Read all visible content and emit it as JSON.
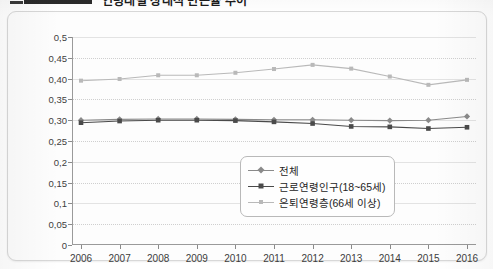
{
  "page": {
    "title_bar": {
      "badge_name": "black-label-block",
      "title_text_fragment": "연령대별 상대적 빈곤율 추이",
      "note": "title row is cropped at the top edge of the screenshot"
    }
  },
  "chart_data": {
    "type": "line",
    "title": "",
    "xlabel": "",
    "ylabel": "",
    "x": [
      2006,
      2007,
      2008,
      2009,
      2010,
      2011,
      2012,
      2013,
      2014,
      2015,
      2016
    ],
    "categories": [
      "2006",
      "2007",
      "2008",
      "2009",
      "2010",
      "2011",
      "2012",
      "2013",
      "2014",
      "2015",
      "2016"
    ],
    "ylim": [
      0,
      0.5
    ],
    "yticks": [
      0,
      0.05,
      0.1,
      0.15,
      0.2,
      0.25,
      0.3,
      0.35,
      0.4,
      0.45,
      0.5
    ],
    "ytick_labels": [
      "0",
      "0,05",
      "0,1",
      "0,15",
      "0,2",
      "0,25",
      "0,30",
      "0,35",
      "0,40",
      "0,45",
      "0,5"
    ],
    "grid": true,
    "grid_style": "dotted-horizontal",
    "legend_position": "lower-right-inside",
    "series": [
      {
        "name": "전체",
        "marker": "diamond",
        "color": "#8a8a8a",
        "values": [
          0.3,
          0.302,
          0.303,
          0.303,
          0.302,
          0.301,
          0.301,
          0.3,
          0.299,
          0.3,
          0.309
        ]
      },
      {
        "name": "근로연령인구(18~65세)",
        "marker": "square",
        "color": "#4a4a4a",
        "values": [
          0.294,
          0.298,
          0.3,
          0.3,
          0.299,
          0.296,
          0.292,
          0.285,
          0.284,
          0.28,
          0.283
        ]
      },
      {
        "name": "은퇴연령층(66세 이상)",
        "marker": "square-small",
        "color": "#b9b9b9",
        "values": [
          0.395,
          0.399,
          0.408,
          0.408,
          0.414,
          0.423,
          0.433,
          0.424,
          0.405,
          0.385,
          0.397
        ]
      }
    ]
  },
  "legend": {
    "items": [
      {
        "label": "전체",
        "marker": "diamond",
        "color": "#8a8a8a"
      },
      {
        "label": "근로연령인구(18~65세)",
        "marker": "square",
        "color": "#4a4a4a"
      },
      {
        "label": "은퇴연령층(66세 이상)",
        "marker": "square-small",
        "color": "#b9b9b9"
      }
    ]
  },
  "colors": {
    "axis": "#9a9a9a",
    "grid": "#cfcfcf",
    "card_border": "#d8d8d8",
    "text": "#3d3d3d"
  }
}
